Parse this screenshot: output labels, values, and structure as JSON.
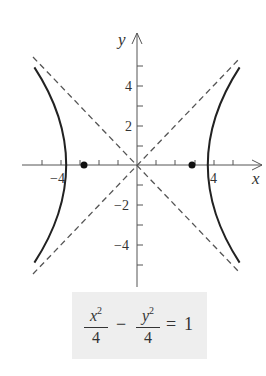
{
  "diagram": {
    "axes": {
      "x_label": "x",
      "y_label": "y",
      "x_tick_labels": [
        {
          "value": -4,
          "text": "−4"
        },
        {
          "value": 4,
          "text": "4"
        }
      ],
      "y_tick_labels": [
        {
          "value": 4,
          "text": "4"
        },
        {
          "value": 2,
          "text": "2"
        },
        {
          "value": -2,
          "text": "−2"
        },
        {
          "value": -4,
          "text": "−4"
        }
      ],
      "x_ticks": [
        -5,
        -4,
        -3,
        -2,
        -1,
        1,
        2,
        3,
        4,
        5
      ],
      "y_ticks": [
        -5,
        -4,
        -3,
        -2,
        -1,
        1,
        2,
        3,
        4,
        5
      ]
    },
    "curve": {
      "equation": "x^2/4 - y^2/4 = 1",
      "a": 2,
      "b": 2,
      "color": "#222222"
    },
    "asymptotes": {
      "lines": [
        "y = x",
        "y = -x"
      ],
      "style": "dashed",
      "color": "#555555"
    },
    "foci": [
      {
        "x": -2.83,
        "y": 0
      },
      {
        "x": 2.83,
        "y": 0
      }
    ],
    "equation_box": {
      "term1_num": "x",
      "term1_exp": "2",
      "term1_den": "4",
      "minus": "−",
      "term2_num": "y",
      "term2_exp": "2",
      "term2_den": "4",
      "equals": "=",
      "rhs": "1",
      "background": "#eeeeee"
    }
  }
}
